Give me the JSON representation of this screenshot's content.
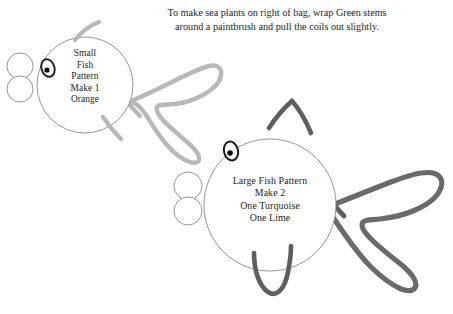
{
  "page": {
    "background_color": "#ffffff",
    "width": 453,
    "height": 314
  },
  "header": {
    "line1": "To make sea plants on right of bag, wrap Green stems",
    "line2": "around a paintbrush and pull the coils out slightly.",
    "full_text": "To make sea plants on right of bag, wrap Green stems around a paintbrush and pull the coils out slightly."
  },
  "small_fish": {
    "label_text": "Small\nFish\nPattern\nMake 1\nOrange",
    "label_lines": [
      "Small",
      "Fish",
      "Pattern",
      "Make 1",
      "Orange"
    ],
    "size_name": "Small",
    "item": "Fish",
    "kind": "Pattern",
    "quantity": "Make 1",
    "colors": [
      "Orange"
    ],
    "body": {
      "cx": 85,
      "cy": 85,
      "r": 48
    },
    "eye": {
      "cx": 48,
      "cy": 68,
      "rx": 6.5,
      "ry": 9,
      "pupil_r": 2.6
    },
    "bubbles": [
      {
        "cx": 20,
        "cy": 66,
        "r": 13
      },
      {
        "cx": 20,
        "cy": 89,
        "r": 13
      }
    ],
    "outline_color": "#8a8a8a",
    "fin_color": "#b8b8b8",
    "tail_color": "#b8b8b8"
  },
  "large_fish": {
    "label_text": "Large Fish Pattern\nMake 2\nOne Turquoise\nOne Lime",
    "label_lines": [
      "Large Fish Pattern",
      "Make 2",
      "One Turquoise",
      "One Lime"
    ],
    "size_name": "Large",
    "item": "Fish",
    "kind": "Pattern",
    "quantity": "Make 2",
    "colors": [
      "One Turquoise",
      "One Lime"
    ],
    "body": {
      "cx": 270,
      "cy": 205,
      "r": 66
    },
    "eye": {
      "cx": 231,
      "cy": 151,
      "rx": 7,
      "ry": 9.5,
      "pupil_r": 2.8
    },
    "bubbles": [
      {
        "cx": 188,
        "cy": 186,
        "r": 14
      },
      {
        "cx": 188,
        "cy": 211,
        "r": 14
      }
    ],
    "outline_color": "#8a8a8a",
    "fin_color": "#5e5e5e",
    "tail_color": "#6a6a6a"
  },
  "colors": {
    "ink": "#231f20",
    "body_outline": "#8a8a8a",
    "light_stroke": "#b8b8b8",
    "dark_stroke": "#5e5e5e",
    "tail_dark": "#6a6a6a",
    "pupil": "#000000",
    "page_background": "#ffffff"
  },
  "icon_names": {
    "small_fish": "fish-outline-icon",
    "large_fish": "fish-outline-icon",
    "bubble": "bubble-circle-icon",
    "eye": "fish-eye-icon",
    "tail": "fish-tail-ribbon-icon",
    "fin": "fish-fin-icon"
  }
}
